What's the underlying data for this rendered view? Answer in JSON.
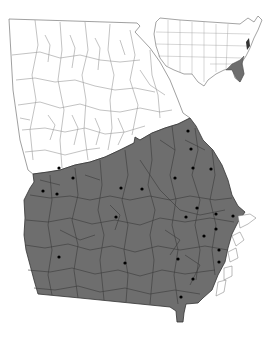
{
  "map": {
    "subject": "Georgia county distribution map",
    "region": "Georgia",
    "shaded_region": "southern / coastal plain counties",
    "colors": {
      "background": "#ffffff",
      "unshaded_fill": "#ffffff",
      "shaded_fill": "#6e6e6e",
      "county_line_light": "#9a9a9a",
      "county_line_dark": "#3a3a3a",
      "dot": "#000000"
    },
    "record_dots": [
      {
        "x": 59,
        "y": 168
      },
      {
        "x": 73,
        "y": 178
      },
      {
        "x": 43,
        "y": 191
      },
      {
        "x": 57,
        "y": 194
      },
      {
        "x": 121,
        "y": 188
      },
      {
        "x": 142,
        "y": 189
      },
      {
        "x": 188,
        "y": 131
      },
      {
        "x": 191,
        "y": 149
      },
      {
        "x": 193,
        "y": 168
      },
      {
        "x": 211,
        "y": 169
      },
      {
        "x": 175,
        "y": 178
      },
      {
        "x": 116,
        "y": 217
      },
      {
        "x": 197,
        "y": 208
      },
      {
        "x": 186,
        "y": 217
      },
      {
        "x": 216,
        "y": 214
      },
      {
        "x": 233,
        "y": 216
      },
      {
        "x": 216,
        "y": 229
      },
      {
        "x": 204,
        "y": 236
      },
      {
        "x": 219,
        "y": 250
      },
      {
        "x": 59,
        "y": 257
      },
      {
        "x": 125,
        "y": 263
      },
      {
        "x": 178,
        "y": 259
      },
      {
        "x": 193,
        "y": 279
      },
      {
        "x": 219,
        "y": 262
      },
      {
        "x": 181,
        "y": 297
      }
    ]
  },
  "inset": {
    "subject": "United States locator map",
    "highlighted": "southeastern coastal plain"
  }
}
